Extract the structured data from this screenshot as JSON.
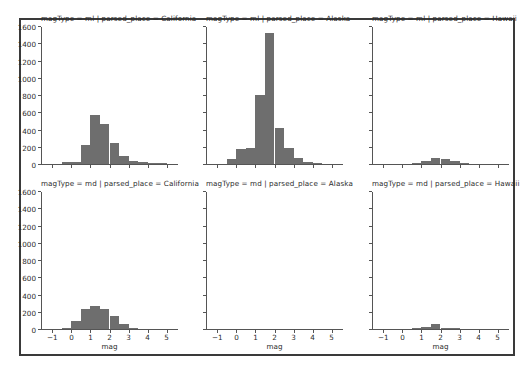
{
  "figure": {
    "width": 528,
    "height": 370,
    "background": "#ffffff",
    "frame_color": "#3a3a3a"
  },
  "style": {
    "bar_color": "#6e6e6e",
    "axis_color": "#555555",
    "text_color": "#2b2b2b"
  },
  "chart_data": {
    "type": "bar",
    "title": "",
    "xlabel": "mag",
    "ylabel": "",
    "xlim": [
      -1.6,
      5.6
    ],
    "ylim": [
      0,
      1600
    ],
    "grid": false,
    "legend": null,
    "bin_width": 0.5,
    "facet_rows": [
      "ml",
      "md"
    ],
    "facet_cols": [
      "California",
      "Alaska",
      "Hawaii"
    ],
    "xticks": [
      -1,
      0,
      1,
      2,
      3,
      4,
      5
    ],
    "xtick_labels": [
      "−1",
      "0",
      "1",
      "2",
      "3",
      "4",
      "5"
    ],
    "yticks": [
      0,
      200,
      400,
      600,
      800,
      1000,
      1200,
      1400,
      1600
    ],
    "ytick_labels": [
      "0",
      "200",
      "400",
      "600",
      "800",
      "1000",
      "1200",
      "1400",
      "1600"
    ],
    "panels": [
      {
        "id": "ml-california",
        "title": "magType = ml | parsed_place = California",
        "magType": "ml",
        "parsed_place": "California",
        "row": 0,
        "col": 0,
        "bin_edges": [
          -0.5,
          0.0,
          0.5,
          1.0,
          1.5,
          2.0,
          2.5,
          3.0,
          3.5,
          4.0,
          4.5,
          5.0
        ],
        "counts": [
          18,
          20,
          215,
          570,
          465,
          245,
          95,
          40,
          18,
          8,
          3
        ]
      },
      {
        "id": "ml-alaska",
        "title": "magType = ml | parsed_place = Alaska",
        "magType": "ml",
        "parsed_place": "Alaska",
        "row": 0,
        "col": 1,
        "bin_edges": [
          -0.5,
          0.0,
          0.5,
          1.0,
          1.5,
          2.0,
          2.5,
          3.0,
          3.5,
          4.0,
          4.5
        ],
        "counts": [
          55,
          175,
          180,
          800,
          1520,
          420,
          190,
          75,
          20,
          5
        ]
      },
      {
        "id": "ml-hawaii",
        "title": "magType = ml | parsed_place = Hawaii",
        "magType": "ml",
        "parsed_place": "Hawaii",
        "row": 0,
        "col": 2,
        "bin_edges": [
          0.5,
          1.0,
          1.5,
          2.0,
          2.5,
          3.0,
          3.5
        ],
        "counts": [
          8,
          30,
          75,
          55,
          30,
          6
        ]
      },
      {
        "id": "md-california",
        "title": "magType = md | parsed_place = California",
        "magType": "md",
        "parsed_place": "California",
        "row": 1,
        "col": 0,
        "bin_edges": [
          -0.5,
          0.0,
          0.5,
          1.0,
          1.5,
          2.0,
          2.5,
          3.0,
          3.5
        ],
        "counts": [
          10,
          90,
          235,
          270,
          235,
          150,
          55,
          15
        ]
      },
      {
        "id": "md-alaska",
        "title": "magType = md | parsed_place = Alaska",
        "magType": "md",
        "parsed_place": "Alaska",
        "row": 1,
        "col": 1,
        "bin_edges": [],
        "counts": []
      },
      {
        "id": "md-hawaii",
        "title": "magType = md | parsed_place = Hawaii",
        "magType": "md",
        "parsed_place": "Hawaii",
        "row": 1,
        "col": 2,
        "bin_edges": [
          0.5,
          1.0,
          1.5,
          2.0,
          2.5,
          3.0
        ],
        "counts": [
          4,
          18,
          55,
          12,
          3
        ]
      }
    ]
  }
}
